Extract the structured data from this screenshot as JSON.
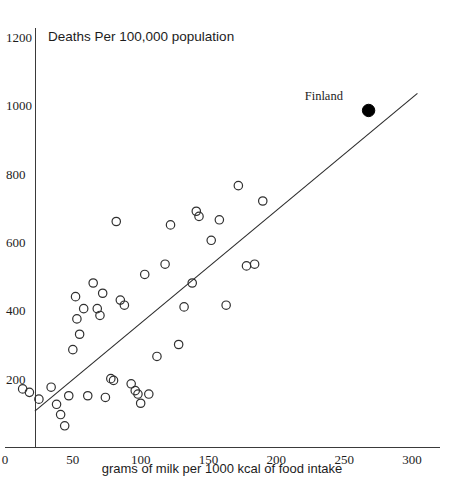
{
  "chart_data": {
    "type": "scatter",
    "title": "Deaths Per 100,000 population",
    "xlabel": "grams of milk per 1000 kcal of food intake",
    "ylabel": "Deaths Per 100,000 population",
    "xlim": [
      0,
      310
    ],
    "ylim": [
      0,
      1240
    ],
    "xticks": [
      0,
      50,
      100,
      150,
      200,
      250,
      300
    ],
    "xtick_labels": [
      "0",
      "50",
      "100",
      "150",
      "200",
      "250",
      "300"
    ],
    "yticks": [
      200,
      400,
      600,
      800,
      1000,
      1200
    ],
    "ytick_labels": [
      "200",
      "400",
      "600",
      "800",
      "1000",
      "1200"
    ],
    "grid": false,
    "legend": false,
    "series": [
      {
        "name": "countries",
        "marker": "open-circle",
        "color": "#303030",
        "points": [
          {
            "x": 13,
            "y": 170
          },
          {
            "x": 18,
            "y": 160
          },
          {
            "x": 25,
            "y": 140
          },
          {
            "x": 34,
            "y": 175
          },
          {
            "x": 38,
            "y": 125
          },
          {
            "x": 41,
            "y": 95
          },
          {
            "x": 44,
            "y": 62
          },
          {
            "x": 47,
            "y": 150
          },
          {
            "x": 50,
            "y": 285
          },
          {
            "x": 52,
            "y": 440
          },
          {
            "x": 53,
            "y": 375
          },
          {
            "x": 55,
            "y": 330
          },
          {
            "x": 58,
            "y": 405
          },
          {
            "x": 61,
            "y": 150
          },
          {
            "x": 65,
            "y": 480
          },
          {
            "x": 68,
            "y": 405
          },
          {
            "x": 70,
            "y": 385
          },
          {
            "x": 72,
            "y": 450
          },
          {
            "x": 74,
            "y": 145
          },
          {
            "x": 78,
            "y": 200
          },
          {
            "x": 80,
            "y": 195
          },
          {
            "x": 82,
            "y": 660
          },
          {
            "x": 85,
            "y": 430
          },
          {
            "x": 88,
            "y": 415
          },
          {
            "x": 93,
            "y": 185
          },
          {
            "x": 96,
            "y": 165
          },
          {
            "x": 98,
            "y": 155
          },
          {
            "x": 100,
            "y": 128
          },
          {
            "x": 103,
            "y": 505
          },
          {
            "x": 106,
            "y": 155
          },
          {
            "x": 112,
            "y": 265
          },
          {
            "x": 118,
            "y": 535
          },
          {
            "x": 122,
            "y": 650
          },
          {
            "x": 128,
            "y": 300
          },
          {
            "x": 132,
            "y": 410
          },
          {
            "x": 138,
            "y": 480
          },
          {
            "x": 141,
            "y": 690
          },
          {
            "x": 143,
            "y": 675
          },
          {
            "x": 152,
            "y": 605
          },
          {
            "x": 158,
            "y": 665
          },
          {
            "x": 163,
            "y": 415
          },
          {
            "x": 172,
            "y": 765
          },
          {
            "x": 178,
            "y": 530
          },
          {
            "x": 184,
            "y": 535
          },
          {
            "x": 190,
            "y": 720
          }
        ]
      },
      {
        "name": "Finland",
        "marker": "filled-circle",
        "color": "#000000",
        "points": [
          {
            "x": 268,
            "y": 985,
            "label": "Finland"
          }
        ]
      }
    ],
    "trend_line": {
      "x0": 22,
      "y0": 105,
      "x1": 304,
      "y1": 1035
    },
    "annotations": [
      {
        "text": "Finland",
        "x": 235,
        "y": 1015
      }
    ]
  },
  "labels": {
    "chart_title": "Deaths Per 100,000 population",
    "x_axis_title": "grams of milk per 1000 kcal of food intake"
  }
}
